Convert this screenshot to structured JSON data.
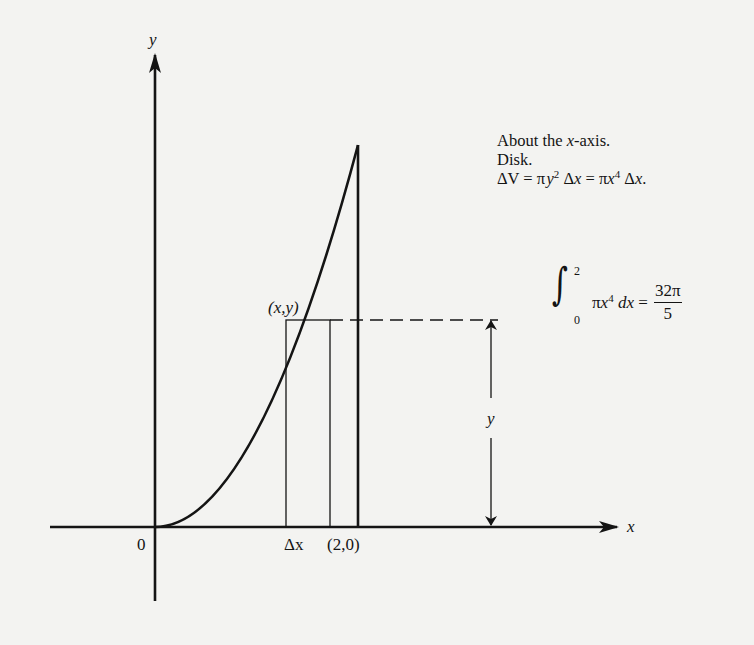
{
  "figure": {
    "type": "solid-of-revolution-diagram",
    "axes": {
      "x_label": "x",
      "y_label": "y",
      "origin_label": "0"
    },
    "curve": {
      "equation": "y = x^2",
      "from_x": 0,
      "to_x": 2
    },
    "point_labels": {
      "sample_point": "(x,y)",
      "endpoint": "(2,0)",
      "strip_width": "Δx",
      "height_label": "y"
    },
    "strip": {
      "kind": "disk",
      "representative_rectangle": true
    }
  },
  "annotation": {
    "line1_prefix": "About the ",
    "line1_var": "x",
    "line1_suffix": "-axis.",
    "line2": "Disk.",
    "line3": {
      "delta_v": "ΔV = π",
      "y": "y",
      "sq": "2",
      "mid": " Δ",
      "x1": "x",
      "eq": " = π",
      "x2": "x",
      "pow4": "4",
      "end": " Δ",
      "x3": "x",
      "dot": "."
    }
  },
  "integral": {
    "sign": "∫",
    "upper": "2",
    "lower": "0",
    "integrand_pi": "π",
    "integrand_var": "x",
    "integrand_pow": "4",
    "d": " d",
    "dvar": "x",
    "equals": " = ",
    "result_numerator": "32π",
    "result_denominator": "5"
  },
  "colors": {
    "ink": "#141414",
    "paper": "#f3f3f1"
  }
}
